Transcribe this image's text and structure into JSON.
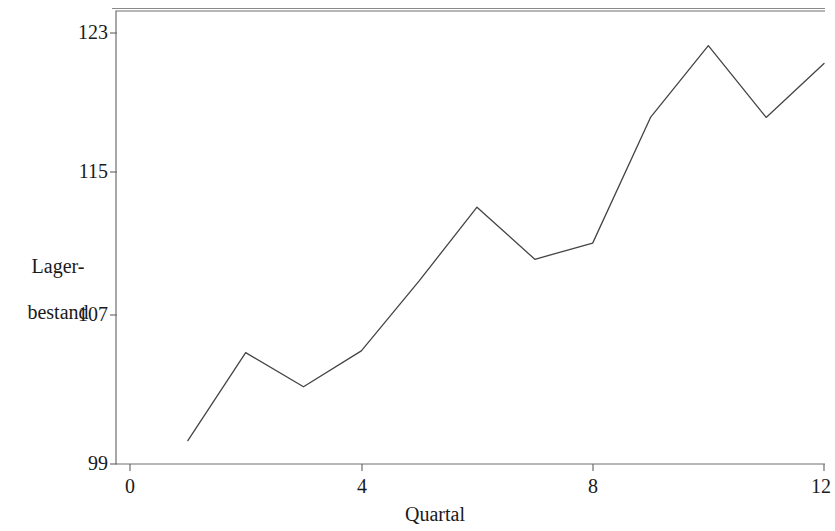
{
  "chart_data": {
    "type": "line",
    "title": "",
    "subtitle": "",
    "xlabel": "Quartal",
    "ylabel": "Lager-\nbestand",
    "ylabel_line1": "Lager-",
    "ylabel_line2": "bestand",
    "x": [
      1,
      2,
      3,
      4,
      5,
      6,
      7,
      8,
      9,
      10,
      11,
      12
    ],
    "values": [
      100.3,
      105.2,
      103.3,
      105.3,
      109.2,
      113.3,
      110.4,
      111.3,
      118.3,
      122.3,
      118.3,
      121.3
    ],
    "series": [
      {
        "name": "Lagerbestand",
        "values": [
          100.3,
          105.2,
          103.3,
          105.3,
          109.2,
          113.3,
          110.4,
          111.3,
          118.3,
          122.3,
          118.3,
          121.3
        ]
      }
    ],
    "xlim": [
      0,
      12
    ],
    "ylim": [
      99,
      123.7
    ],
    "xticks": [
      0,
      4,
      8,
      12
    ],
    "xtick_labels": [
      "0",
      "4",
      "8",
      "12"
    ],
    "yticks": [
      99,
      107,
      115,
      123
    ],
    "ytick_labels": [
      "99",
      "107",
      "115",
      "123"
    ],
    "grid": false,
    "legend": false,
    "legend_position": "none",
    "line_color": "#444444",
    "axis_color": "#6e6e6e",
    "background_color": "#ffffff"
  },
  "axes": {
    "y_title_line1": "Lager-",
    "y_title_line2": "bestand",
    "x_title": "Quartal"
  },
  "y_ticks": [
    {
      "label": "123",
      "value": 123
    },
    {
      "label": "115",
      "value": 115
    },
    {
      "label": "107",
      "value": 107
    },
    {
      "label": "99",
      "value": 99
    }
  ],
  "x_ticks": [
    {
      "label": "0",
      "value": 0
    },
    {
      "label": "4",
      "value": 4
    },
    {
      "label": "8",
      "value": 8
    },
    {
      "label": "12",
      "value": 12
    }
  ]
}
